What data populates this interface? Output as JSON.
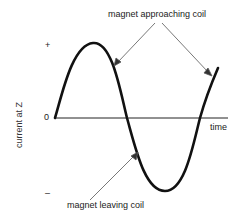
{
  "diagram": {
    "ylabel": "current at Z",
    "xlabel": "time",
    "ticks": {
      "plus": "+",
      "zero": "0",
      "minus": "–"
    },
    "annotations": {
      "top": "magnet approaching coil",
      "bottom": "magnet leaving coil"
    },
    "colors": {
      "curve": "#111111",
      "axis": "#222222",
      "arrow": "#555555"
    }
  }
}
